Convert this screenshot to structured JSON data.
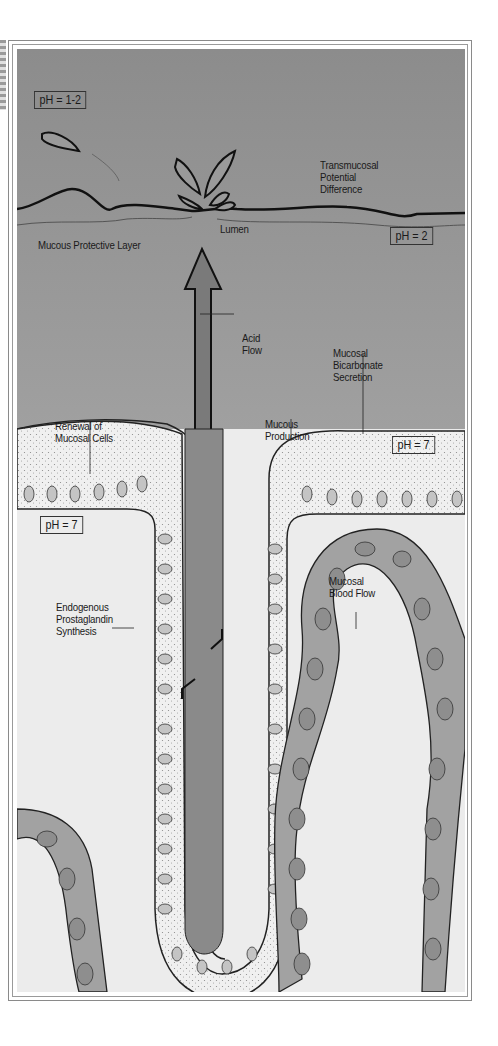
{
  "figure": {
    "title": "",
    "regions": {
      "lumen_color": "#8e8e8e",
      "tissue_color": "#ececec",
      "frame_color": "#8a8a8a"
    },
    "ph_boxes": [
      {
        "id": "ph-lumen-top",
        "text": "pH = 1-2"
      },
      {
        "id": "ph-lumen-right",
        "text": "pH = 2"
      },
      {
        "id": "ph-mucus",
        "text": "pH = 7"
      },
      {
        "id": "ph-tissue",
        "text": "pH = 7"
      }
    ],
    "labels": {
      "transmucosal": "Transmucosal\nPotential\nDifference",
      "lumen": "Lumen",
      "mucous_layer": "Mucous Protective Layer",
      "acid_flow": "Acid\nFlow",
      "bicarbonate": "Mucosal\nBicarbonate\nSecretion",
      "renewal": "Renewal of\nMucosal Cells",
      "mucous_production": "Mucous\nProduction",
      "blood_flow": "Mucosal\nBlood Flow",
      "prostaglandin": "Endogenous\nProstaglandin\nSynthesis"
    }
  }
}
